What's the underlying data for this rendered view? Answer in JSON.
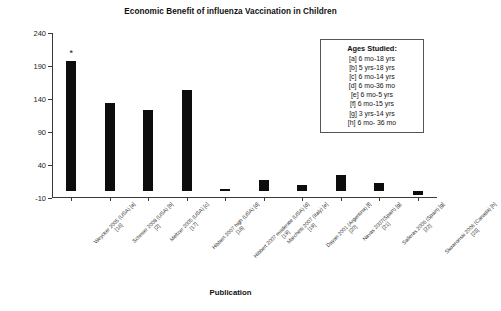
{
  "chart_data": {
    "type": "bar",
    "title": "Economic Benefit of influenza Vaccination in Children",
    "xlabel": "Publication",
    "ylabel": "",
    "ylim": [
      -10,
      240
    ],
    "yticks": [
      240,
      190,
      140,
      90,
      40,
      -10
    ],
    "grid": false,
    "legend_position": "upper-right",
    "categories": [
      "Weycker 2005 (USA) [a]",
      "Schmier 2008 (USA) [b]",
      "Meltzer 2005 (USA) [c]",
      "Hibbert 2007 high (USA) [d]",
      "Hibbert 2007 moderate (USA) [d]",
      "Marchetti 2007 (Italy) [e]",
      "Dayan 2001 (Argentina) [f]",
      "Navas 2007(Spain) [g]",
      "Salleras 2006 (Spain) [g]",
      "Skowronski 2006 (Canada) [h]"
    ],
    "references": [
      "[16]",
      "[2]",
      "[17]",
      "[18]",
      "[19]",
      "[19]",
      "[20]",
      "[21]",
      "[22]",
      "[23]"
    ],
    "values": [
      197,
      134,
      124,
      154,
      3,
      18,
      10,
      25,
      12,
      -5
    ],
    "annotations": [
      {
        "category_index": 0,
        "text": "*"
      }
    ],
    "bar_color": "#0d0d0d"
  },
  "legend": {
    "title": "Ages Studied:",
    "items": [
      "[a] 6 mo-18 yrs",
      "[b] 5 yrs-18 yrs",
      "[c] 6 mo-14 yrs",
      "[d] 6 mo-36 mo",
      "[e] 6 mo-5 yrs",
      "[f] 6 mo-15 yrs",
      "[g] 3 yrs-14 yrs",
      "[h] 6 mo- 36 mo"
    ]
  }
}
